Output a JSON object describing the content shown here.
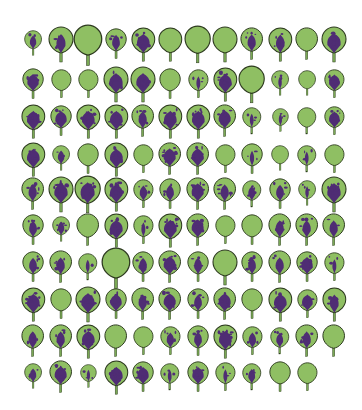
{
  "image": {
    "description": "Grid of leaf silhouettes showing purple pigmentation spots",
    "background": "#ffffff",
    "colors": {
      "leaf_fill": "#8fbf63",
      "leaf_outline": "#2d3a1f",
      "pigment": "#4f2d74",
      "stem": "#7aa955"
    },
    "grid": {
      "columns": 12,
      "rows": 10,
      "col_x": [
        33,
        61,
        88,
        116,
        143,
        170,
        198,
        225,
        252,
        280,
        307,
        334
      ],
      "row_y": [
        40,
        80,
        117,
        155,
        190,
        226,
        263,
        300,
        337,
        373
      ]
    },
    "rows": [
      [
        [
          0.7,
          2
        ],
        [
          1.0,
          2
        ],
        [
          1.15,
          0
        ],
        [
          0.85,
          2
        ],
        [
          0.95,
          3
        ],
        [
          0.95,
          0
        ],
        [
          1.05,
          0
        ],
        [
          1.0,
          0
        ],
        [
          0.9,
          2
        ],
        [
          0.95,
          2
        ],
        [
          0.9,
          0
        ],
        [
          1.0,
          3
        ]
      ],
      [
        [
          0.85,
          3
        ],
        [
          0.8,
          0
        ],
        [
          0.8,
          0
        ],
        [
          1.0,
          3
        ],
        [
          1.0,
          3
        ],
        [
          0.85,
          0
        ],
        [
          0.8,
          1
        ],
        [
          0.95,
          3
        ],
        [
          1.05,
          0
        ],
        [
          0.7,
          1
        ],
        [
          0.7,
          0
        ],
        [
          0.8,
          3
        ]
      ],
      [
        [
          0.95,
          3
        ],
        [
          0.85,
          3
        ],
        [
          0.95,
          3
        ],
        [
          0.95,
          3
        ],
        [
          0.9,
          2
        ],
        [
          0.95,
          3
        ],
        [
          0.95,
          3
        ],
        [
          0.9,
          3
        ],
        [
          0.75,
          1
        ],
        [
          0.65,
          1
        ],
        [
          0.75,
          0
        ],
        [
          0.8,
          3
        ]
      ],
      [
        [
          0.95,
          3
        ],
        [
          0.7,
          2
        ],
        [
          0.85,
          0
        ],
        [
          0.95,
          3
        ],
        [
          0.8,
          0
        ],
        [
          0.9,
          3
        ],
        [
          0.9,
          3
        ],
        [
          0.8,
          0
        ],
        [
          0.85,
          1
        ],
        [
          0.7,
          0
        ],
        [
          0.75,
          1
        ],
        [
          0.8,
          0
        ]
      ],
      [
        [
          0.9,
          2
        ],
        [
          1.0,
          3
        ],
        [
          1.05,
          3
        ],
        [
          0.95,
          3
        ],
        [
          0.8,
          2
        ],
        [
          0.85,
          2
        ],
        [
          0.9,
          3
        ],
        [
          0.9,
          2
        ],
        [
          0.75,
          2
        ],
        [
          0.85,
          2
        ],
        [
          0.7,
          1
        ],
        [
          1.0,
          3
        ]
      ],
      [
        [
          0.85,
          2
        ],
        [
          0.7,
          2
        ],
        [
          0.9,
          0
        ],
        [
          0.95,
          3
        ],
        [
          0.8,
          1
        ],
        [
          0.95,
          3
        ],
        [
          0.9,
          3
        ],
        [
          0.8,
          0
        ],
        [
          0.85,
          0
        ],
        [
          0.9,
          2
        ],
        [
          0.9,
          2
        ],
        [
          0.9,
          2
        ]
      ],
      [
        [
          0.85,
          2
        ],
        [
          0.9,
          2
        ],
        [
          0.75,
          1
        ],
        [
          1.15,
          0
        ],
        [
          0.85,
          2
        ],
        [
          0.9,
          3
        ],
        [
          0.85,
          2
        ],
        [
          1.0,
          0
        ],
        [
          0.85,
          2
        ],
        [
          0.9,
          2
        ],
        [
          0.85,
          3
        ],
        [
          0.8,
          1
        ]
      ],
      [
        [
          0.95,
          3
        ],
        [
          0.85,
          0
        ],
        [
          1.0,
          3
        ],
        [
          0.85,
          3
        ],
        [
          0.9,
          2
        ],
        [
          0.9,
          3
        ],
        [
          0.85,
          2
        ],
        [
          0.9,
          3
        ],
        [
          0.85,
          0
        ],
        [
          0.95,
          3
        ],
        [
          0.8,
          3
        ],
        [
          0.95,
          2
        ]
      ],
      [
        [
          0.9,
          2
        ],
        [
          0.9,
          2
        ],
        [
          0.95,
          3
        ],
        [
          0.9,
          0
        ],
        [
          0.8,
          0
        ],
        [
          0.8,
          2
        ],
        [
          0.85,
          2
        ],
        [
          0.95,
          3
        ],
        [
          0.8,
          2
        ],
        [
          0.75,
          2
        ],
        [
          0.9,
          2
        ],
        [
          0.9,
          0
        ]
      ],
      [
        [
          0.7,
          2
        ],
        [
          0.9,
          3
        ],
        [
          0.65,
          1
        ],
        [
          0.95,
          3
        ],
        [
          0.85,
          3
        ],
        [
          0.75,
          1
        ],
        [
          0.85,
          3
        ],
        [
          0.8,
          1
        ],
        [
          0.75,
          2
        ],
        [
          0.85,
          0
        ],
        [
          0.8,
          0
        ]
      ]
    ]
  }
}
